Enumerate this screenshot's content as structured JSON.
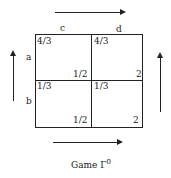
{
  "columns": [
    "c",
    "d"
  ],
  "rows": [
    "a",
    "b"
  ],
  "cells": [
    [
      {
        "top_left": "4/3",
        "bottom_right": "1/2"
      },
      {
        "top_left": "4/3",
        "bottom_right": "2"
      }
    ],
    [
      {
        "top_left": "1/3",
        "bottom_right": "1/2"
      },
      {
        "top_left": "1/3",
        "bottom_right": "2"
      }
    ]
  ],
  "arrows": {
    "top": "right",
    "bottom": "right",
    "left": "up",
    "right": "up"
  },
  "caption": {
    "text": "Game Γ",
    "superscript": "0"
  }
}
